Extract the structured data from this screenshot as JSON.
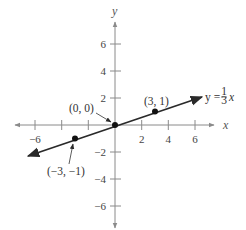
{
  "graph": {
    "axis_labels": {
      "x": "x",
      "y": "y"
    },
    "x_ticks": [
      {
        "value": -6,
        "label": "−6"
      },
      {
        "value": -4,
        "label": ""
      },
      {
        "value": -2,
        "label": ""
      },
      {
        "value": 2,
        "label": "2"
      },
      {
        "value": 4,
        "label": "4"
      },
      {
        "value": 6,
        "label": "6"
      }
    ],
    "y_ticks": [
      {
        "value": 6,
        "label": "6"
      },
      {
        "value": 4,
        "label": "4"
      },
      {
        "value": 2,
        "label": "2"
      },
      {
        "value": -2,
        "label": "−2"
      },
      {
        "value": -4,
        "label": "−4"
      },
      {
        "value": -6,
        "label": "−6"
      }
    ],
    "line": {
      "equation_prefix": "y =",
      "fraction_num": "1",
      "fraction_den": "3",
      "equation_suffix": "x",
      "slope": 0.3333,
      "intercept": 0
    },
    "points": [
      {
        "x": 0,
        "y": 0,
        "label": "(0, 0)"
      },
      {
        "x": 3,
        "y": 1,
        "label": "(3, 1)"
      },
      {
        "x": -3,
        "y": -1,
        "label": "(−3, −1)"
      }
    ],
    "colors": {
      "axis": "#8a8a8a",
      "line": "#2a2a2a",
      "point": "#111111"
    }
  }
}
